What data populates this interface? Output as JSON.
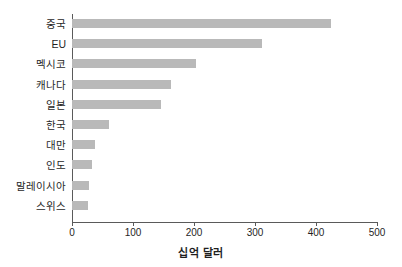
{
  "chart_data": {
    "type": "bar",
    "orientation": "horizontal",
    "title": "",
    "xlabel": "십억 달러",
    "ylabel": "",
    "categories": [
      "중국",
      "EU",
      "멕시코",
      "캐나다",
      "일본",
      "한국",
      "대만",
      "인도",
      "말레이시아",
      "스위스"
    ],
    "values": [
      425,
      311,
      203,
      162,
      146,
      60,
      38,
      33,
      28,
      27
    ],
    "xlim": [
      0,
      500
    ],
    "xticks": [
      0,
      100,
      200,
      300,
      400,
      500
    ],
    "xticklabels": [
      "0",
      "100",
      "200",
      "300",
      "400",
      "500"
    ],
    "grid": false,
    "legend": null,
    "bar_color": "#b9b9b9",
    "axis_color": "#5a5a5a",
    "background": "#ffffff"
  }
}
